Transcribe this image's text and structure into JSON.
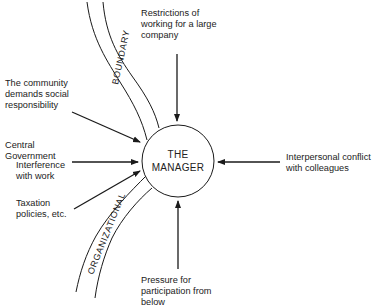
{
  "diagram": {
    "center": {
      "line1": "THE",
      "line2": "MANAGER"
    },
    "boundary_labels": {
      "top": "BOUNDARY",
      "bottom": "ORGANIZATIONAL"
    },
    "pressures": [
      {
        "id": "top",
        "text": "Restrictions of\nworking for a large\ncompany",
        "direction": "down"
      },
      {
        "id": "community",
        "text": "The community\ndemands social\nresponsibility",
        "direction": "down-right"
      },
      {
        "id": "government",
        "text": "Central\nGovernment",
        "direction": "right"
      },
      {
        "id": "interference",
        "text": "Interference\nwith work",
        "direction": "right"
      },
      {
        "id": "taxation",
        "text": "Taxation\npolicies, etc.",
        "direction": "up-right"
      },
      {
        "id": "colleagues",
        "text": "Interpersonal conflict\nwith colleagues",
        "direction": "left"
      },
      {
        "id": "below",
        "text": "Pressure for\nparticipation from\nbelow",
        "direction": "up"
      }
    ],
    "colors": {
      "line": "#1a1a1a",
      "background": "#ffffff"
    }
  }
}
